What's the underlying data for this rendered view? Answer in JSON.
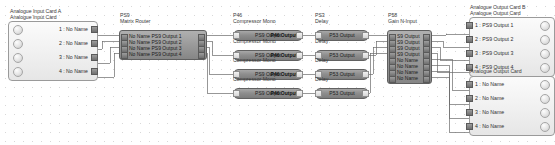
{
  "diagram": {
    "type": "audio-dsp-signal-flow",
    "background_grid": true
  },
  "input_card": {
    "title_line1": "Analogue Input Card A",
    "title_line2": "Analogue Input Card",
    "rows": [
      {
        "label": "1 : No Name"
      },
      {
        "label": "2 : No Name"
      },
      {
        "label": "3 : No Name"
      },
      {
        "label": "4 : No Name"
      }
    ]
  },
  "matrix_router": {
    "id": "PS9",
    "name": "Matrix Router",
    "rows": [
      {
        "label": "No Name PS9 Output 1"
      },
      {
        "label": "No Name PS9 Output 2"
      },
      {
        "label": "No Name PS9 Output 3"
      },
      {
        "label": "No Name PS9 Output 4"
      }
    ]
  },
  "compressor": {
    "id": "P46",
    "name": "Compressor Mono",
    "blocks": [
      {
        "title": "Compressor Mono",
        "text_a": "PS9 Output",
        "text_b": "P46 Output 1"
      },
      {
        "title": "Compressor Mono",
        "text_a": "PS9 Output",
        "text_b": "P46 Output 2"
      },
      {
        "title": "Compressor Mono",
        "text_a": "PS9 Output",
        "text_b": "P46 Output 3"
      },
      {
        "title": "Compressor Mono",
        "text_a": "PS9 Output",
        "text_b": "P46 Output 4"
      }
    ]
  },
  "delay": {
    "id": "PS3",
    "name": "Delay",
    "blocks": [
      {
        "title": "Delay",
        "text_a": "P53 Output"
      },
      {
        "title": "Delay",
        "text_a": "P53 Output"
      },
      {
        "title": "Delay",
        "text_a": "P53 Output"
      },
      {
        "title": "Delay",
        "text_a": "P53 Output"
      }
    ]
  },
  "gain": {
    "id": "P58",
    "name": "Gain N-Input",
    "rows": [
      {
        "label": "S9 Output"
      },
      {
        "label": "S9 Output"
      },
      {
        "label": "S9 Output"
      },
      {
        "label": "S9 Output"
      },
      {
        "label": "No Name"
      },
      {
        "label": "No Name"
      },
      {
        "label": "No Name"
      },
      {
        "label": "No Name"
      }
    ]
  },
  "output_card_b": {
    "title_line1": "Analogue Output Card B",
    "title_line2": "Analogue Output Card",
    "rows": [
      {
        "label": "1 : PS9 Output 1"
      },
      {
        "label": "2 : PS9 Output 2"
      },
      {
        "label": "3 : PS9 Output 3"
      },
      {
        "label": "4 : PS9 Output 4"
      }
    ]
  },
  "output_card_c": {
    "title_line1": "Analogue Output Card",
    "rows": [
      {
        "label": "1 : No Name"
      },
      {
        "label": "2 : No Name"
      },
      {
        "label": "3 : No Name"
      },
      {
        "label": "4 : No Name"
      }
    ]
  },
  "colors": {
    "block_fill": "#8e8e8e",
    "card_fill": "#f0f0f0",
    "wire": "#6b6b6b",
    "border": "#9a9a9a"
  }
}
